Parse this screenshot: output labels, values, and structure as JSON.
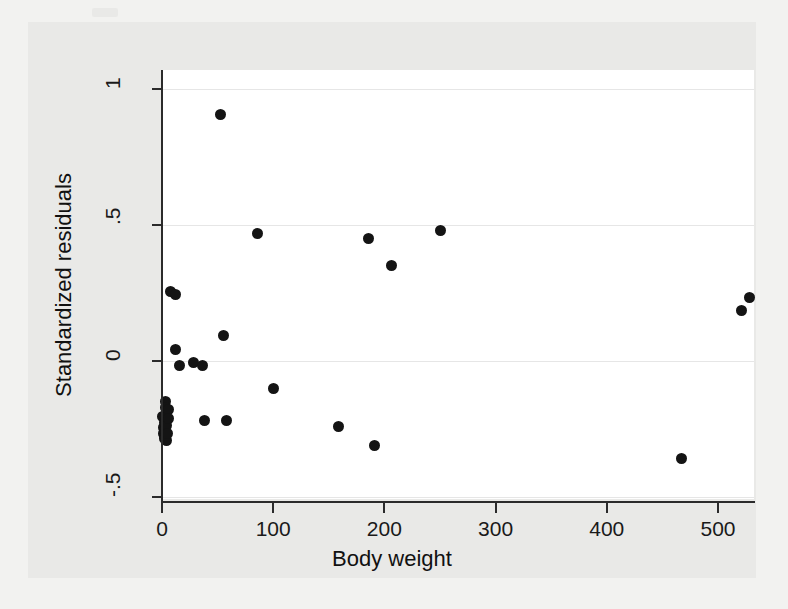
{
  "chart_data": {
    "type": "scatter",
    "title": "",
    "subtitle": "",
    "xlabel": "Body weight",
    "ylabel": "Standardized residuals",
    "xlim": [
      -20,
      552
    ],
    "ylim": [
      -0.56,
      1.04
    ],
    "xticks": [
      0,
      100,
      200,
      300,
      400,
      500
    ],
    "xticklabels": [
      "0",
      "100",
      "200",
      "300",
      "400",
      "500"
    ],
    "yticks": [
      -0.5,
      0,
      0.5,
      1
    ],
    "yticklabels": [
      "-.5",
      "0",
      ".5",
      "1"
    ],
    "grid": "horizontal",
    "legend": "none",
    "marker": "filled-circle",
    "marker_color": "#141414",
    "plot_background": "#ffffff",
    "graph_background": "#e9e9e7",
    "page_background": "#f2f2f0",
    "n_points": 33,
    "points": [
      {
        "x": 0.5,
        "y": -0.205
      },
      {
        "x": 1.0,
        "y": -0.245
      },
      {
        "x": 1.4,
        "y": -0.265
      },
      {
        "x": 1.8,
        "y": -0.275
      },
      {
        "x": 2.0,
        "y": -0.285
      },
      {
        "x": 2.4,
        "y": -0.255
      },
      {
        "x": 2.6,
        "y": -0.225
      },
      {
        "x": 3.0,
        "y": -0.15
      },
      {
        "x": 3.2,
        "y": -0.172
      },
      {
        "x": 3.5,
        "y": -0.262
      },
      {
        "x": 4.0,
        "y": -0.292
      },
      {
        "x": 4.4,
        "y": -0.238
      },
      {
        "x": 5.0,
        "y": -0.268
      },
      {
        "x": 5.5,
        "y": -0.178
      },
      {
        "x": 6.0,
        "y": -0.212
      },
      {
        "x": 8.0,
        "y": 0.255
      },
      {
        "x": 12.0,
        "y": 0.243
      },
      {
        "x": 12.5,
        "y": 0.044
      },
      {
        "x": 16.0,
        "y": -0.018
      },
      {
        "x": 28.0,
        "y": -0.007
      },
      {
        "x": 36.0,
        "y": -0.018
      },
      {
        "x": 38.0,
        "y": -0.218
      },
      {
        "x": 53.0,
        "y": 0.905
      },
      {
        "x": 55.0,
        "y": 0.092
      },
      {
        "x": 58.0,
        "y": -0.218
      },
      {
        "x": 86.0,
        "y": 0.467
      },
      {
        "x": 100.0,
        "y": -0.1
      },
      {
        "x": 159.0,
        "y": -0.24
      },
      {
        "x": 186.0,
        "y": 0.452
      },
      {
        "x": 191.0,
        "y": -0.31
      },
      {
        "x": 206.0,
        "y": 0.35
      },
      {
        "x": 250.0,
        "y": 0.48
      },
      {
        "x": 467.0,
        "y": -0.36
      },
      {
        "x": 521.0,
        "y": 0.185
      },
      {
        "x": 528.0,
        "y": 0.232
      }
    ]
  }
}
